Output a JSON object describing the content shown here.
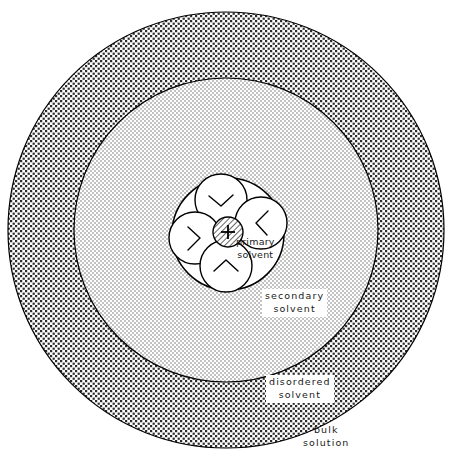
{
  "figure": {
    "canvas": {
      "width": 459,
      "height": 462
    },
    "background_color": "#ffffff",
    "line_color": "#000000"
  },
  "shells": [
    {
      "id": "primary",
      "name": "primary-solvent-shell",
      "label_line1": "primary",
      "label_line2": "solvent",
      "center": {
        "x": 228,
        "y": 234
      },
      "radius": 56,
      "fill": "#ffffff",
      "texture": "none",
      "label_on_texture": false
    },
    {
      "id": "secondary",
      "name": "secondary-solvent-shell",
      "label_line1": "secondary",
      "label_line2": "solvent",
      "center": {
        "x": 226,
        "y": 230
      },
      "radius": 152,
      "fill": "#d8d8d8",
      "texture": "fine-stipple",
      "label_on_texture": true
    },
    {
      "id": "disordered",
      "name": "disordered-solvent-shell",
      "label_line1": "disordered",
      "label_line2": "solvent",
      "center": {
        "x": 226,
        "y": 230
      },
      "radius": 218,
      "fill": "#ffffff",
      "texture": "coarse-dots",
      "label_on_texture": true
    },
    {
      "id": "bulk",
      "name": "bulk-solution-region",
      "label_line1": "bulk",
      "label_line2": "solution",
      "center": null,
      "radius": null,
      "fill": "#ffffff",
      "texture": "none",
      "label_on_texture": false
    }
  ],
  "central_ion": {
    "name": "central-cation",
    "charge_symbol": "+",
    "center": {
      "x": 228,
      "y": 232
    },
    "radius": 15,
    "texture": "diagonal-hatch",
    "fill": "#ffffff"
  },
  "solvent_molecules": [
    {
      "id": "top",
      "name": "solvent-molecule-top",
      "center": {
        "x": 221,
        "y": 200
      },
      "radius": 26,
      "dipole_rotation_deg": 180
    },
    {
      "id": "right",
      "name": "solvent-molecule-right",
      "center": {
        "x": 261,
        "y": 223
      },
      "radius": 26,
      "dipole_rotation_deg": 270
    },
    {
      "id": "left",
      "name": "solvent-molecule-left",
      "center": {
        "x": 195,
        "y": 238
      },
      "radius": 26,
      "dipole_rotation_deg": 90
    },
    {
      "id": "bottom",
      "name": "solvent-molecule-bottom",
      "center": {
        "x": 226,
        "y": 266
      },
      "radius": 26,
      "dipole_rotation_deg": 0
    }
  ]
}
